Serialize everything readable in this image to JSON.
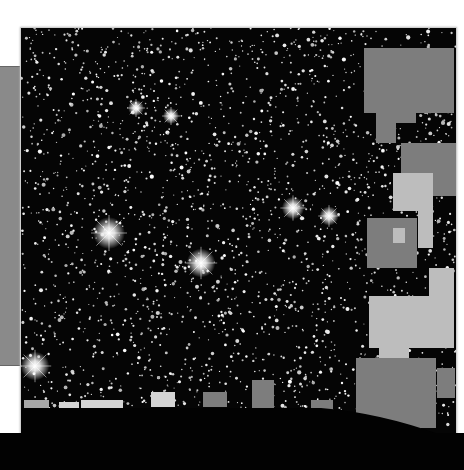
{
  "image": {
    "subject": "Dense star field with bright diffraction-spiked stars and gray masked rectangular regions",
    "background_color": "#050505",
    "star_color": "#f2f2f2",
    "mask_colors": [
      "#7d7d7d",
      "#bdbdbd",
      "#d4d4d4"
    ]
  },
  "bright_stars": [
    {
      "x": 88,
      "y": 205,
      "r": 10
    },
    {
      "x": 180,
      "y": 235,
      "r": 9
    },
    {
      "x": 272,
      "y": 180,
      "r": 7
    },
    {
      "x": 308,
      "y": 188,
      "r": 6
    },
    {
      "x": 14,
      "y": 338,
      "r": 9
    },
    {
      "x": 115,
      "y": 80,
      "r": 5
    },
    {
      "x": 150,
      "y": 88,
      "r": 5
    }
  ],
  "masks": [
    {
      "x": 343,
      "y": 20,
      "w": 90,
      "h": 65,
      "c": "#7d7d7d"
    },
    {
      "x": 355,
      "y": 65,
      "w": 40,
      "h": 30,
      "c": "#7d7d7d"
    },
    {
      "x": 355,
      "y": 95,
      "w": 20,
      "h": 20,
      "c": "#7d7d7d"
    },
    {
      "x": 380,
      "y": 115,
      "w": 60,
      "h": 40,
      "c": "#7d7d7d"
    },
    {
      "x": 410,
      "y": 130,
      "w": 25,
      "h": 38,
      "c": "#7d7d7d"
    },
    {
      "x": 372,
      "y": 145,
      "w": 40,
      "h": 38,
      "c": "#bdbdbd"
    },
    {
      "x": 397,
      "y": 175,
      "w": 15,
      "h": 45,
      "c": "#bdbdbd"
    },
    {
      "x": 346,
      "y": 190,
      "w": 50,
      "h": 50,
      "c": "#7d7d7d"
    },
    {
      "x": 372,
      "y": 200,
      "w": 12,
      "h": 15,
      "c": "#bdbdbd"
    },
    {
      "x": 348,
      "y": 268,
      "w": 85,
      "h": 52,
      "c": "#bdbdbd"
    },
    {
      "x": 408,
      "y": 240,
      "w": 25,
      "h": 40,
      "c": "#bdbdbd"
    },
    {
      "x": 358,
      "y": 300,
      "w": 30,
      "h": 30,
      "c": "#bdbdbd"
    },
    {
      "x": 335,
      "y": 330,
      "w": 80,
      "h": 70,
      "c": "#7d7d7d"
    },
    {
      "x": 360,
      "y": 390,
      "w": 40,
      "h": 20,
      "c": "#7d7d7d"
    },
    {
      "x": 416,
      "y": 340,
      "w": 18,
      "h": 30,
      "c": "#7d7d7d"
    },
    {
      "x": 3,
      "y": 372,
      "w": 25,
      "h": 16,
      "c": "#a8a8a8"
    },
    {
      "x": 38,
      "y": 374,
      "w": 20,
      "h": 20,
      "c": "#d4d4d4"
    },
    {
      "x": 60,
      "y": 372,
      "w": 42,
      "h": 30,
      "c": "#d4d4d4"
    },
    {
      "x": 130,
      "y": 364,
      "w": 24,
      "h": 15,
      "c": "#d4d4d4"
    },
    {
      "x": 182,
      "y": 364,
      "w": 24,
      "h": 15,
      "c": "#7d7d7d"
    },
    {
      "x": 231,
      "y": 352,
      "w": 22,
      "h": 30,
      "c": "#7d7d7d"
    },
    {
      "x": 290,
      "y": 372,
      "w": 22,
      "h": 10,
      "c": "#7d7d7d"
    }
  ]
}
